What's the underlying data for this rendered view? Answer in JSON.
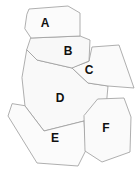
{
  "figure": {
    "width": 138,
    "height": 173,
    "background_color": "#ffffff"
  },
  "style": {
    "fill_color": "#fafafa",
    "fill_color_alt": "#f5f5f5",
    "stroke_color": "#9a9a9a",
    "stroke_width": 0.8,
    "label_color": "#101010",
    "label_font_size": 12
  },
  "regions": [
    {
      "id": "A",
      "label": "A",
      "label_x": 45,
      "label_y": 24,
      "points": "27,14 29,9 68,6 80,13 80,36 31,38 25,29",
      "fill": "#fbfbfb"
    },
    {
      "id": "B",
      "label": "B",
      "label_x": 68,
      "label_y": 52,
      "points": "31,38 80,36 90,40 89,61 72,68 37,60 27,50",
      "fill": "#f8f8f8"
    },
    {
      "id": "C",
      "label": "C",
      "label_x": 89,
      "label_y": 71,
      "points": "89,61 92,47 119,45 134,88 108,86 88,83 72,68",
      "fill": "#fafafa"
    },
    {
      "id": "D",
      "label": "D",
      "label_x": 60,
      "label_y": 99,
      "points": "27,50 37,60 72,68 88,83 108,86 106,108 84,121 44,131 25,106 22,78",
      "fill": "#f9f9f9"
    },
    {
      "id": "E",
      "label": "E",
      "label_x": 55,
      "label_y": 139,
      "points": "25,106 44,131 84,121 86,150 78,166 37,163 8,116 12,104",
      "fill": "#fbfbfb"
    },
    {
      "id": "F",
      "label": "F",
      "label_x": 106,
      "label_y": 129,
      "points": "98,99 124,98 131,117 130,152 102,162 85,151 84,116",
      "fill": "#fafafa"
    }
  ]
}
